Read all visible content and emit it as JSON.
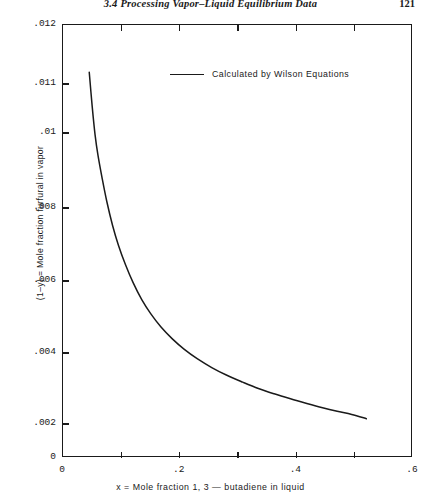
{
  "runhead": {
    "title": "3.4   Processing Vapor–Liquid Equilibrium Data",
    "page": "121"
  },
  "legend": {
    "label": "Calculated by Wilson Equations",
    "line_color": "#1a1a1a"
  },
  "chart_data": {
    "type": "line",
    "title": "",
    "xlabel": "x  =  Mole  fraction  1, 3  —  butadiene  in  liquid",
    "ylabel": "(1–y) = Mole fraction furfural in vapor",
    "xlim": [
      0,
      0.6
    ],
    "ylim": [
      0,
      0.012
    ],
    "grid": false,
    "legend_position": "top-center",
    "x_ticks_major": [
      "0",
      ".2",
      ".4",
      ".6"
    ],
    "x_ticks_major_values": [
      0,
      0.2,
      0.4,
      0.6
    ],
    "x_ticks_minor_values": [
      0.1,
      0.3,
      0.5
    ],
    "y_ticks": [
      ".012",
      ".011",
      ".01",
      ".008",
      ".006",
      ".004",
      ".002",
      "0"
    ],
    "y_tick_values": [
      0.012,
      0.011,
      0.01,
      0.008,
      0.006,
      0.004,
      0.002,
      0
    ],
    "y_tick_pixel_fractions": [
      0.0,
      0.1363,
      0.2494,
      0.4226,
      0.5912,
      0.7575,
      0.9215,
      1.0
    ],
    "series": [
      {
        "name": "Calculated by Wilson Equations",
        "color": "#1a1a1a",
        "points": [
          [
            0.045,
            0.0112
          ],
          [
            0.05,
            0.01055
          ],
          [
            0.055,
            0.00995
          ],
          [
            0.06,
            0.0094
          ],
          [
            0.067,
            0.0088
          ],
          [
            0.075,
            0.00818
          ],
          [
            0.085,
            0.00752
          ],
          [
            0.095,
            0.00698
          ],
          [
            0.107,
            0.00645
          ],
          [
            0.12,
            0.00596
          ],
          [
            0.135,
            0.00548
          ],
          [
            0.15,
            0.0051
          ],
          [
            0.168,
            0.00472
          ],
          [
            0.187,
            0.0044
          ],
          [
            0.208,
            0.0041
          ],
          [
            0.23,
            0.00384
          ],
          [
            0.255,
            0.00359
          ],
          [
            0.28,
            0.00338
          ],
          [
            0.308,
            0.00318
          ],
          [
            0.335,
            0.003
          ],
          [
            0.362,
            0.00285
          ],
          [
            0.39,
            0.00271
          ],
          [
            0.418,
            0.00258
          ],
          [
            0.445,
            0.00246
          ],
          [
            0.47,
            0.00236
          ],
          [
            0.495,
            0.00227
          ],
          [
            0.52,
            0.00215
          ]
        ]
      }
    ]
  }
}
